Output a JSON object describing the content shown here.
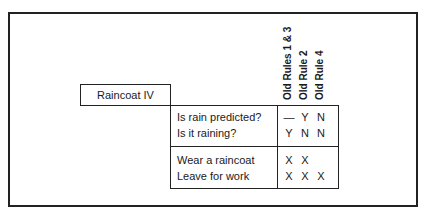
{
  "title": "Raincoat IV",
  "rule_columns": [
    "Old Rules 1 & 3",
    "Old Rule 2",
    "Old Rule 4"
  ],
  "conditions": [
    {
      "label": "Is rain predicted?",
      "values": [
        "—",
        "Y",
        "N"
      ]
    },
    {
      "label": "Is it raining?",
      "values": [
        "Y",
        "N",
        "N"
      ]
    }
  ],
  "actions": [
    {
      "label": "Wear a raincoat",
      "values": [
        "X",
        "X",
        ""
      ]
    },
    {
      "label": "Leave for work",
      "values": [
        "X",
        "X",
        "X"
      ]
    }
  ]
}
